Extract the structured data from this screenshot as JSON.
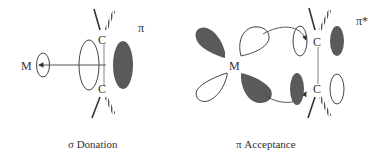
{
  "diagram": {
    "colors": {
      "line": "#444444",
      "filled_lobe": "#5a5a5a",
      "text": "#333333",
      "background": "#ffffff"
    },
    "left_panel": {
      "caption": "σ  Donation",
      "metal_label": "M",
      "carbon_top": "C",
      "carbon_bottom": "C",
      "orbital_label": "π"
    },
    "right_panel": {
      "caption": "π  Acceptance",
      "metal_label": "M",
      "carbon_top": "C",
      "carbon_bottom": "C",
      "orbital_label": "π*"
    }
  }
}
